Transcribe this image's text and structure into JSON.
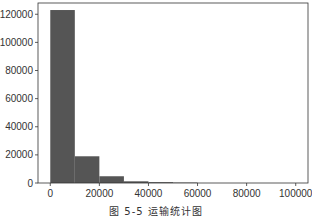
{
  "chart_data": {
    "type": "bar",
    "title": "",
    "xlabel": "",
    "ylabel": "",
    "bin_edges": [
      0,
      10000,
      20000,
      30000,
      40000,
      50000,
      60000
    ],
    "categories": [
      "0-10000",
      "10000-20000",
      "20000-30000",
      "30000-40000",
      "40000-50000",
      "50000-60000"
    ],
    "values": [
      123000,
      19000,
      4800,
      1200,
      600,
      300
    ],
    "xlim": [
      -5000,
      105000
    ],
    "ylim": [
      0,
      128000
    ],
    "xticks": [
      0,
      20000,
      40000,
      60000,
      80000,
      100000
    ],
    "xtick_labels": [
      "0",
      "20000",
      "40000",
      "60000",
      "80000",
      "100000"
    ],
    "yticks": [
      0,
      20000,
      40000,
      60000,
      80000,
      100000,
      120000
    ],
    "ytick_labels": [
      "0",
      "20000",
      "40000",
      "60000",
      "80000",
      "100000",
      "120000"
    ],
    "bar_color": "#555555",
    "grid": false,
    "legend": null
  },
  "caption": "图 5-5   运输统计图"
}
